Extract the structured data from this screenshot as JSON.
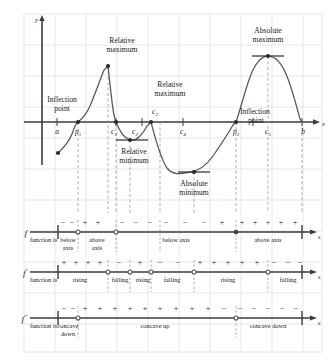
{
  "figure": {
    "background_color": "#ffffff",
    "grid_color": "#d8d8de",
    "curve_color": "#4a4a52",
    "axis_color": "#2a2a2a"
  },
  "graph": {
    "y_axis_label": "y",
    "x_axis_label": "x",
    "annotations": [
      {
        "id": "inflection-point-left",
        "line1": "Inflection",
        "line2": "point"
      },
      {
        "id": "relative-maximum-c1",
        "line1": "Relative",
        "line2": "maximum"
      },
      {
        "id": "relative-maximum-c3",
        "line1": "Relative",
        "line2": "maximum"
      },
      {
        "id": "relative-minimum-c2",
        "line1": "Relative",
        "line2": "minimum"
      },
      {
        "id": "absolute-minimum-c4",
        "line1": "Absolute",
        "line2": "minimum"
      },
      {
        "id": "absolute-maximum-c5",
        "line1": "Absolute",
        "line2": "maximum"
      },
      {
        "id": "inflection-point-right",
        "line1": "Inflection",
        "line2": "point"
      }
    ],
    "x_tick_labels": [
      {
        "id": "a",
        "base": "a",
        "sub": ""
      },
      {
        "id": "p1",
        "base": "p",
        "sub": "1"
      },
      {
        "id": "c1",
        "base": "c",
        "sub": "1"
      },
      {
        "id": "c2",
        "base": "c",
        "sub": "2"
      },
      {
        "id": "c3",
        "base": "c",
        "sub": "3"
      },
      {
        "id": "c4",
        "base": "c",
        "sub": "4"
      },
      {
        "id": "p2",
        "base": "p",
        "sub": "2"
      },
      {
        "id": "c5",
        "base": "c",
        "sub": "5"
      },
      {
        "id": "b",
        "base": "b",
        "sub": ""
      }
    ]
  },
  "sign_charts": [
    {
      "id": "f-sign-chart",
      "symbol": "f",
      "prime": "",
      "axis_label": "x",
      "caption": "function is",
      "signs": [
        "−",
        "−",
        "+",
        "+",
        "−",
        "−",
        "−",
        "−",
        "−",
        "−",
        "+",
        "+",
        "+",
        "+",
        "+",
        "+"
      ],
      "intervals": [
        {
          "line1": "below",
          "line2": "axis"
        },
        {
          "line1": "above",
          "line2": "axis"
        },
        {
          "line1": "below axis",
          "line2": ""
        },
        {
          "line1": "above axis",
          "line2": ""
        }
      ]
    },
    {
      "id": "f-prime-sign-chart",
      "symbol": "f",
      "prime": "′",
      "axis_label": "x",
      "caption": "function is",
      "signs": [
        "+",
        "+",
        "+",
        "+",
        "−",
        "+",
        "−",
        "−",
        "+",
        "+",
        "+",
        "+",
        "+",
        "−",
        "−",
        "−"
      ],
      "intervals": [
        {
          "line1": "rising",
          "line2": ""
        },
        {
          "line1": "falling",
          "line2": ""
        },
        {
          "line1": "rising",
          "line2": ""
        },
        {
          "line1": "falling",
          "line2": ""
        },
        {
          "line1": "rising",
          "line2": ""
        },
        {
          "line1": "falling",
          "line2": ""
        }
      ]
    },
    {
      "id": "f-double-prime-sign-chart",
      "symbol": "f",
      "prime": "″",
      "axis_label": "x",
      "caption": "function is",
      "signs": [
        "−",
        "−",
        "+",
        "+",
        "+",
        "+",
        "+",
        "+",
        "+",
        "+",
        "+",
        "−",
        "−",
        "−",
        "−",
        "−",
        "−"
      ],
      "intervals": [
        {
          "line1": "concave",
          "line2": "down"
        },
        {
          "line1": "concave up",
          "line2": ""
        },
        {
          "line1": "concave down",
          "line2": ""
        }
      ]
    }
  ]
}
